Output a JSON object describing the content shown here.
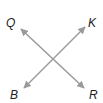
{
  "diagram": {
    "type": "intersecting-lines",
    "line_color": "#9a9a9a",
    "label_color": "#222222",
    "lines": [
      {
        "name": "QR",
        "from": "Q",
        "to": "R",
        "arrows": "both"
      },
      {
        "name": "BK",
        "from": "B",
        "to": "K",
        "arrows": "both"
      }
    ],
    "labels": {
      "Q": "Q",
      "K": "K",
      "B": "B",
      "R": "R"
    }
  }
}
